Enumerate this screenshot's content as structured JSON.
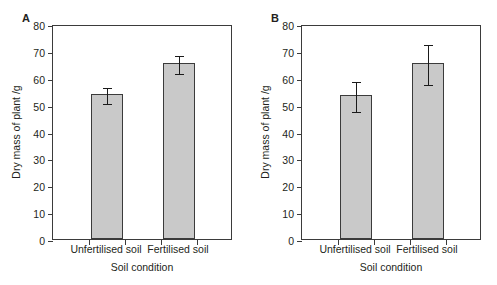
{
  "figure": {
    "background": "#ffffff",
    "bar_fill": "#c9c9c9",
    "bar_stroke": "#3b3b3b",
    "error_color": "#1a1a1a"
  },
  "chart_data": [
    {
      "type": "bar",
      "panel_label": "A",
      "title": "",
      "categories": [
        "Unfertilised soil",
        "Fertilised soil"
      ],
      "values": [
        54.0,
        65.5
      ],
      "errors": [
        3.0,
        3.5
      ],
      "xlabel": "Soil condition",
      "ylabel": "Dry mass of plant /g",
      "ylim": [
        0,
        80
      ],
      "yticks": [
        0,
        10,
        20,
        30,
        40,
        50,
        60,
        70,
        80
      ],
      "ytick_labels": [
        "0",
        "10",
        "20",
        "30",
        "40",
        "50",
        "60",
        "70",
        "80"
      ],
      "grid": false,
      "legend": false
    },
    {
      "type": "bar",
      "panel_label": "B",
      "title": "",
      "categories": [
        "Unfertilised soil",
        "Fertilised soil"
      ],
      "values": [
        53.5,
        65.5
      ],
      "errors": [
        5.5,
        7.5
      ],
      "xlabel": "Soil condition",
      "ylabel": "Dry mass of plant /g",
      "ylim": [
        0,
        80
      ],
      "yticks": [
        0,
        10,
        20,
        30,
        40,
        50,
        60,
        70,
        80
      ],
      "ytick_labels": [
        "0",
        "10",
        "20",
        "30",
        "40",
        "50",
        "60",
        "70",
        "80"
      ],
      "grid": false,
      "legend": false
    }
  ]
}
